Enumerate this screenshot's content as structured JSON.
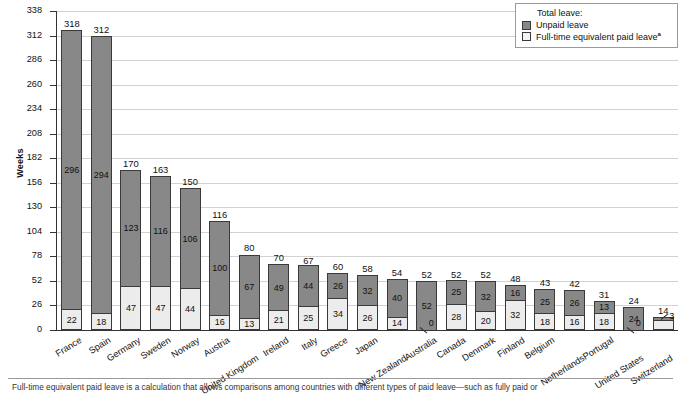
{
  "chart_data": {
    "type": "bar",
    "subtype": "stacked-bar",
    "title": "",
    "xlabel": "",
    "ylabel": "Weeks",
    "ylim": [
      0,
      338
    ],
    "ytick_step": 26,
    "yticks": [
      0,
      26,
      52,
      78,
      104,
      130,
      156,
      182,
      208,
      234,
      260,
      286,
      312,
      338
    ],
    "grid": true,
    "grid_axis": "y",
    "legend_position": "top-right",
    "legend_title": "Total leave:",
    "categories": [
      "France",
      "Spain",
      "Germany",
      "Sweden",
      "Norway",
      "Austria",
      "United Kingdom",
      "Ireland",
      "Italy",
      "Greece",
      "Japan",
      "New Zealand",
      "Australia",
      "Canada",
      "Denmark",
      "Finland",
      "Belgium",
      "Netherlands",
      "Portugal",
      "United States",
      "Switzerland"
    ],
    "series": [
      {
        "name": "Full-time equivalent paid leave",
        "key": "paid",
        "color": "#ececec",
        "values": [
          22,
          18,
          47,
          47,
          44,
          16,
          13,
          21,
          25,
          34,
          26,
          14,
          0,
          28,
          20,
          32,
          18,
          16,
          18,
          0,
          11
        ]
      },
      {
        "name": "Unpaid leave",
        "key": "unpaid",
        "color": "#888888",
        "values": [
          296,
          294,
          123,
          116,
          106,
          100,
          67,
          49,
          44,
          26,
          32,
          40,
          52,
          25,
          32,
          16,
          25,
          26,
          13,
          24,
          3
        ]
      }
    ],
    "totals": [
      318,
      312,
      170,
      163,
      150,
      116,
      80,
      70,
      67,
      60,
      58,
      54,
      52,
      52,
      52,
      48,
      43,
      42,
      31,
      24,
      14
    ],
    "total_label_text": "Total leave:"
  },
  "legend": {
    "title": "Total leave:",
    "items": [
      {
        "label": "Unpaid leave",
        "swatch": "unpaid",
        "superscript": ""
      },
      {
        "label": "Full-time equivalent paid leave",
        "swatch": "paid",
        "superscript": "a"
      }
    ]
  },
  "footnote": {
    "marker": "a",
    "text": "Full-time equivalent paid leave is a calculation that allows comparisons among countries with different types of paid leave—such as fully paid or"
  },
  "colors": {
    "unpaid": "#888888",
    "paid": "#ececec",
    "axis": "#333333",
    "grid": "#d2d2d2",
    "text": "#111111"
  }
}
